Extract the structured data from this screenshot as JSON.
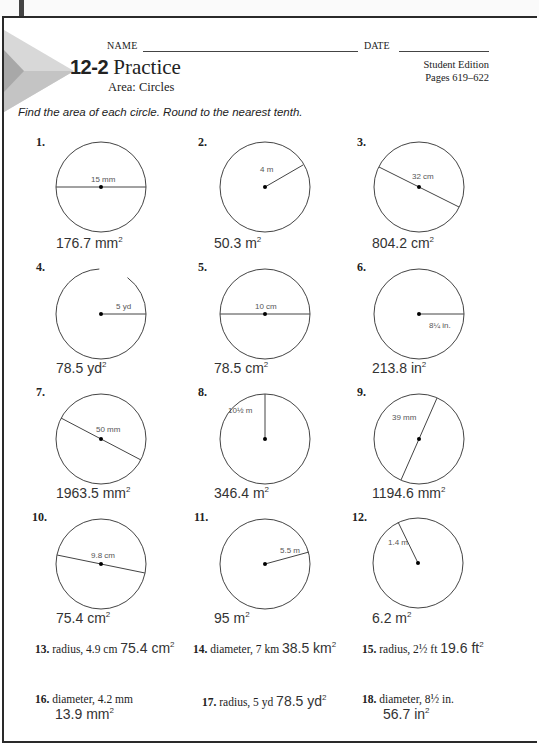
{
  "header": {
    "name_label": "NAME",
    "date_label": "DATE",
    "lesson_number": "12-2",
    "title": "Practice",
    "subtitle": "Area: Circles",
    "edition_line1": "Student Edition",
    "edition_line2": "Pages 619–622"
  },
  "instructions": "Find the area of each circle. Round to the nearest tenth.",
  "problems": [
    {
      "num": "1.",
      "label": "15 mm",
      "measure": "diameter",
      "answer": "176.7 mm",
      "unit_exp": "2"
    },
    {
      "num": "2.",
      "label": "4 m",
      "measure": "radius",
      "answer": "50.3 m",
      "unit_exp": "2"
    },
    {
      "num": "3.",
      "label": "32 cm",
      "measure": "diameter",
      "answer": "804.2 cm",
      "unit_exp": "2"
    },
    {
      "num": "4.",
      "label": "5 yd",
      "measure": "radius",
      "answer": "78.5 yd",
      "unit_exp": "2"
    },
    {
      "num": "5.",
      "label": "10 cm",
      "measure": "diameter",
      "answer": "78.5 cm",
      "unit_exp": "2"
    },
    {
      "num": "6.",
      "label": "8¼ in.",
      "measure": "radius",
      "answer": "213.8 in",
      "unit_exp": "2"
    },
    {
      "num": "7.",
      "label": "50 mm",
      "measure": "diameter",
      "answer": "1963.5 mm",
      "unit_exp": "2"
    },
    {
      "num": "8.",
      "label": "10½ m",
      "measure": "radius",
      "answer": "346.4 m",
      "unit_exp": "2"
    },
    {
      "num": "9.",
      "label": "39 mm",
      "measure": "diameter",
      "answer": "1194.6 mm",
      "unit_exp": "2"
    },
    {
      "num": "10.",
      "label": "9.8 cm",
      "measure": "diameter",
      "answer": "75.4 cm",
      "unit_exp": "2"
    },
    {
      "num": "11.",
      "label": "5.5 m",
      "measure": "radius",
      "answer": "95 m",
      "unit_exp": "2"
    },
    {
      "num": "12.",
      "label": "1.4 m",
      "measure": "radius",
      "answer": "6.2 m",
      "unit_exp": "2"
    }
  ],
  "word_problems": [
    {
      "num": "13.",
      "text": "radius, 4.9 cm",
      "answer": "75.4 cm",
      "unit_exp": "2"
    },
    {
      "num": "14.",
      "text": "diameter, 7 km",
      "answer": "38.5 km",
      "unit_exp": "2"
    },
    {
      "num": "15.",
      "text": "radius, 2½ ft",
      "answer": "19.6 ft",
      "unit_exp": "2"
    },
    {
      "num": "16.",
      "text": "diameter, 4.2 mm",
      "answer": "13.9 mm",
      "unit_exp": "2"
    },
    {
      "num": "17.",
      "text": "radius, 5 yd",
      "answer": "78.5 yd",
      "unit_exp": "2"
    },
    {
      "num": "18.",
      "text": "diameter, 8½ in.",
      "answer": "56.7 in",
      "unit_exp": "2"
    }
  ]
}
